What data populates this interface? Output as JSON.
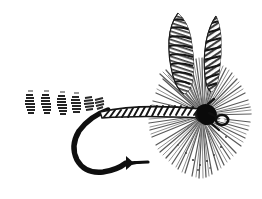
{
  "image": {
    "kind": "line-art-illustration",
    "subject": "dry-fly-fishing-lure",
    "alt_text": "Black and white illustration of a dry fly fishing lure with barred tail fibers, ribbed body on a hook, radial hackle collar and two upright barred feather wings",
    "width": 262,
    "height": 199,
    "background_color": "#ffffff",
    "ink_color": "#1a1a1a",
    "mid_tone_color": "#4a4a4a",
    "light_tone_color": "#8d8d8d"
  },
  "parts": {
    "tail": {
      "name": "Tail",
      "description": "Barred fiber tail, short stacked segments",
      "fiber_count": 6,
      "x_start": 24,
      "x_end": 100,
      "y_center": 104,
      "color": "#2b2b2b"
    },
    "body": {
      "name": "Body",
      "description": "Ribbed / segmented shank wrap with diagonal bars",
      "rib_count": 18,
      "x_start": 98,
      "x_end": 205,
      "y_center": 112,
      "color": "#1f1f1f"
    },
    "hook": {
      "name": "Hook",
      "description": "Black hook with curved bend and barbed point",
      "shank_y": 114,
      "bend_bottom_y": 172,
      "point_x": 118,
      "color": "#111111"
    },
    "hackle": {
      "name": "Hackle",
      "description": "Radial collar of stiff fibers around the head",
      "fiber_count": 72,
      "center_x": 205,
      "center_y": 116,
      "radius": 58,
      "color": "#555555"
    },
    "head": {
      "name": "Head",
      "description": "Dark thread head with hook eye loop",
      "center_x": 207,
      "center_y": 116,
      "color": "#0d0d0d"
    },
    "eye": {
      "name": "Hook eye",
      "description": "Small wire loop at the front of the hook",
      "center_x": 222,
      "center_y": 120
    },
    "wing_left": {
      "name": "Left wing",
      "description": "Upright barred feather quill, rounded tip, horizontal bars",
      "tip_x": 178,
      "tip_y": 13,
      "base_x": 192,
      "base_y": 92,
      "bar_count": 11
    },
    "wing_right": {
      "name": "Right wing",
      "description": "Upright barred feather quill, narrower, diagonal bars",
      "tip_x": 216,
      "tip_y": 16,
      "base_x": 209,
      "base_y": 90,
      "bar_count": 10
    }
  }
}
